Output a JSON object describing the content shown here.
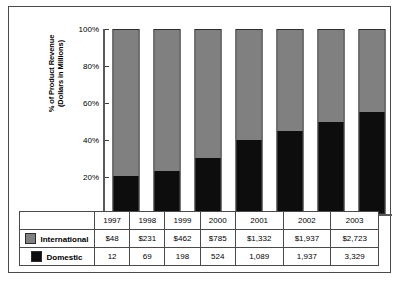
{
  "chart_data": {
    "type": "bar",
    "subtype": "100% stacked bar",
    "title": "",
    "xlabel": "",
    "ylabel": "% of Product Revenue\n(Dollars in Millions)",
    "ylim": [
      0,
      100
    ],
    "grid": false,
    "legend_position": "table-left",
    "categories": [
      "1997",
      "1998",
      "1999",
      "2000",
      "2001",
      "2002",
      "2003"
    ],
    "ytick_labels": [
      "0%",
      "20%",
      "40%",
      "60%",
      "80%",
      "100%"
    ],
    "ytick_values": [
      0,
      20,
      40,
      60,
      80,
      100
    ],
    "series": [
      {
        "name": "International",
        "color": "#808080",
        "values": [
          48,
          231,
          462,
          785,
          1332,
          1937,
          2723
        ],
        "display_values": [
          "$48",
          "$231",
          "$462",
          "$785",
          "$1,332",
          "$1,937",
          "$2,723"
        ],
        "percent_of_total": [
          80.0,
          77.0,
          70.0,
          60.0,
          55.0,
          50.0,
          45.0
        ]
      },
      {
        "name": "Domestic",
        "color": "#0d0d0d",
        "values": [
          12,
          69,
          198,
          524,
          1089,
          1937,
          3329
        ],
        "display_values": [
          "12",
          "69",
          "198",
          "524",
          "1,089",
          "1,937",
          "3,329"
        ],
        "percent_of_total": [
          20.0,
          23.0,
          30.0,
          40.0,
          45.0,
          50.0,
          55.0
        ]
      }
    ]
  },
  "table": {
    "year_row": [
      "1997",
      "1998",
      "1999",
      "2000",
      "2001",
      "2002",
      "2003"
    ],
    "rows": [
      {
        "label": "International",
        "swatch": "gray-swatch",
        "cells": [
          "$48",
          "$231",
          "$462",
          "$785",
          "$1,332",
          "$1,937",
          "$2,723"
        ]
      },
      {
        "label": "Domestic",
        "swatch": "black-swatch",
        "cells": [
          "12",
          "69",
          "198",
          "524",
          "1,089",
          "1,937",
          "3,329"
        ]
      }
    ]
  },
  "colors": {
    "international": "#808080",
    "domestic": "#0d0d0d",
    "frame": "#4a4a4a",
    "axis": "#5a5a5a"
  }
}
